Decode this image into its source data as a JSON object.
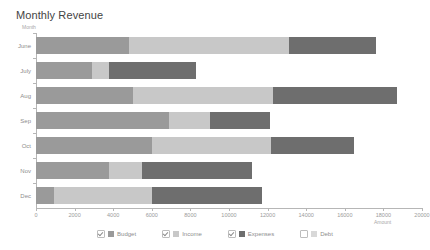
{
  "chart_data": {
    "type": "bar",
    "orientation": "horizontal",
    "stacked": true,
    "title": "Monthly Revenue",
    "xlabel": "Amount",
    "ylabel": "Month",
    "categories": [
      "June",
      "July",
      "Aug",
      "Sep",
      "Oct",
      "Nov",
      "Dec"
    ],
    "xlim": [
      0,
      20000
    ],
    "xticks": [
      0,
      2000,
      4000,
      6000,
      8000,
      10000,
      12000,
      14000,
      16000,
      18000,
      20000
    ],
    "xtick_labels": [
      "0",
      "2000",
      "4000",
      "6000",
      "8000",
      "10000",
      "12000",
      "14000",
      "16000",
      "18000",
      "20000"
    ],
    "grid": false,
    "legend_position": "bottom",
    "series": [
      {
        "name": "Budget",
        "color": "#9a9a9a",
        "visible": true,
        "values": [
          4800,
          2900,
          5000,
          6900,
          6000,
          3800,
          950
        ]
      },
      {
        "name": "Income",
        "color": "#c8c8c8",
        "visible": true,
        "values": [
          8300,
          900,
          7300,
          2100,
          6200,
          1700,
          5050
        ]
      },
      {
        "name": "Expenses",
        "color": "#6e6e6e",
        "visible": true,
        "values": [
          4500,
          4500,
          6400,
          3100,
          4300,
          5700,
          5700
        ]
      },
      {
        "name": "Debt",
        "color": "#d8d8d8",
        "visible": false,
        "values": [
          0,
          0,
          0,
          0,
          0,
          0,
          0
        ]
      }
    ],
    "totals": [
      17600,
      8300,
      18700,
      12100,
      16500,
      11200,
      11700
    ]
  }
}
